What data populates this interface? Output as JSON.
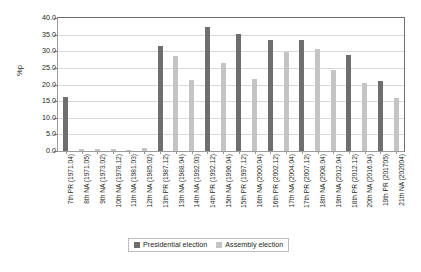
{
  "chart_data": {
    "type": "bar",
    "title": "",
    "subtitle": "",
    "xlabel": "",
    "ylabel": "%p",
    "ylim": [
      0.0,
      40.0
    ],
    "ytick_step": 5.0,
    "ytick_labels": [
      "40.0",
      "35.0",
      "30.0",
      "25.0",
      "20.0",
      "15.0",
      "10.0",
      "5.0",
      "0.0"
    ],
    "ytick_values": [
      40.0,
      35.0,
      30.0,
      25.0,
      20.0,
      15.0,
      10.0,
      5.0,
      0.0
    ],
    "grid": true,
    "grid_axis": "y",
    "legend_position": "bottom-center",
    "categories": [
      "7th PR (1971.04)",
      "8th NA (1971.05)",
      "9th NA (1973.02)",
      "10th NA (1978.12)",
      "11th NA (1981.03)",
      "12th NA (1985.02)",
      "13th PR (1987.12)",
      "13th NA (1988.04)",
      "14th NA (1992.03)",
      "14th PR (1992.12)",
      "15th NA (1996.04)",
      "15th PR (1997.12)",
      "16th NA (2000.04)",
      "16th PR (2002.12)",
      "17th NA (2004.04)",
      "17th PR (2007.12)",
      "18th NA (2008.04)",
      "19th NA (2012.04)",
      "18th PR (2012.12)",
      "20th NA (2016.04)",
      "19th PR (201705)",
      "21th NA (202004)"
    ],
    "series": [
      {
        "name": "Presidential election",
        "color": "#6e6e6e",
        "values": [
          16.3,
          null,
          null,
          null,
          null,
          null,
          31.6,
          null,
          null,
          37.3,
          null,
          35.1,
          null,
          33.3,
          null,
          33.4,
          null,
          null,
          29.0,
          null,
          21.0,
          null
        ]
      },
      {
        "name": "Assembly election",
        "color": "#c4c4c4",
        "values": [
          null,
          0.6,
          0.5,
          0.7,
          0.4,
          0.9,
          null,
          28.7,
          21.5,
          null,
          26.4,
          null,
          21.8,
          null,
          29.9,
          null,
          30.7,
          24.5,
          null,
          20.4,
          null,
          15.8
        ]
      }
    ],
    "legend": [
      {
        "label": "Presidential election",
        "color": "#6e6e6e"
      },
      {
        "label": "Assembly election",
        "color": "#c4c4c4"
      }
    ]
  }
}
